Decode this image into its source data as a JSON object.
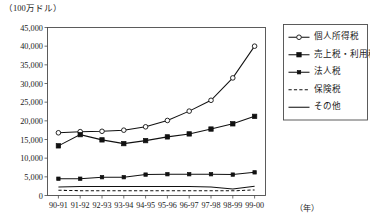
{
  "chart_data": {
    "type": "line",
    "title": "",
    "unit_caption": "（100万ドル）",
    "xlabel": "（年）",
    "ylabel": "",
    "ylim": [
      0,
      45000
    ],
    "ytick_labels": [
      "45,000",
      "40,000",
      "35,000",
      "30,000",
      "25,000",
      "20,000",
      "15,000",
      "10,000",
      "5,000",
      "0"
    ],
    "ytick_values": [
      45000,
      40000,
      35000,
      30000,
      25000,
      20000,
      15000,
      10000,
      5000,
      0
    ],
    "grid": false,
    "legend_position": "top-right",
    "categories": [
      "90-91",
      "91-92",
      "92-93",
      "93-94",
      "94-95",
      "95-96",
      "96-97",
      "97-98",
      "98-99",
      "99-00"
    ],
    "series": [
      {
        "name": "個人所得税",
        "marker": "open-circle",
        "line_style": "solid",
        "values": [
          16800,
          17100,
          17200,
          17500,
          18400,
          20100,
          22600,
          25500,
          31500,
          40000
        ]
      },
      {
        "name": "売上税・利用税",
        "marker": "filled-square",
        "line_style": "solid",
        "values": [
          13300,
          16300,
          14900,
          13900,
          14700,
          15700,
          16500,
          17800,
          19200,
          21200
        ]
      },
      {
        "name": "法人税",
        "marker": "filled-square-small",
        "line_style": "solid",
        "values": [
          4500,
          4500,
          4900,
          4900,
          5600,
          5700,
          5700,
          5700,
          5600,
          6200
        ]
      },
      {
        "name": "保険税",
        "marker": "none",
        "line_style": "dashed",
        "values": [
          1400,
          1300,
          1300,
          1250,
          1250,
          1250,
          1250,
          1250,
          1250,
          1500
        ]
      },
      {
        "name": "その他",
        "marker": "none",
        "line_style": "solid",
        "values": [
          2300,
          2400,
          2400,
          2400,
          2400,
          2400,
          2400,
          2300,
          1750,
          2500
        ]
      }
    ]
  },
  "legend": {
    "items": [
      {
        "label": "個人所得税"
      },
      {
        "label": "売上税・利用税"
      },
      {
        "label": "法人税"
      },
      {
        "label": "保険税"
      },
      {
        "label": "その他"
      }
    ]
  }
}
